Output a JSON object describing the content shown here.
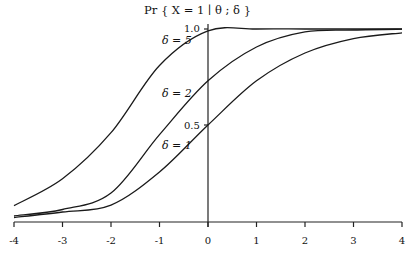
{
  "chart_data": {
    "type": "line",
    "xlabel": "",
    "ylabel": "",
    "xlim": [
      -4,
      4
    ],
    "ylim": [
      0,
      1
    ],
    "grid": false,
    "legend": "inline labels",
    "x_ticks": [
      "-4",
      "-3",
      "-2",
      "-1",
      "0",
      "1",
      "2",
      "3",
      "4"
    ],
    "y_ticks": [
      "0.5",
      "1.0"
    ],
    "x": [
      -4,
      -3,
      -2,
      -1,
      0,
      1,
      2,
      3,
      4
    ],
    "series": [
      {
        "name": "δ = 5",
        "values": [
          0.08,
          0.22,
          0.46,
          0.81,
          0.99,
          1.0,
          1.0,
          1.0,
          1.0
        ]
      },
      {
        "name": "δ = 2",
        "values": [
          0.026,
          0.06,
          0.146,
          0.45,
          0.73,
          0.906,
          0.985,
          0.995,
          0.999
        ]
      },
      {
        "name": "δ = 1",
        "values": [
          0.018,
          0.047,
          0.083,
          0.255,
          0.5,
          0.73,
          0.875,
          0.95,
          0.98
        ]
      }
    ],
    "annotations": [
      "δ = 5",
      "δ = 2",
      "δ = 1",
      "1.0",
      "0.5"
    ]
  },
  "labels": {
    "title": "Pr { X = 1 ∣ θ ; δ }",
    "y_top": "1.0",
    "y_mid": "0.5",
    "delta5": "δ = 5",
    "delta2": "δ = 2",
    "delta1": "δ = 1"
  }
}
